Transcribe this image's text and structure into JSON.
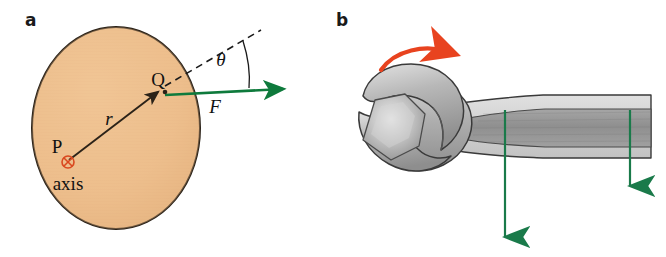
{
  "figure": {
    "background_color": "#ffffff",
    "width": 666,
    "height": 257
  },
  "panel_a": {
    "label": "a",
    "caption_letter": "a",
    "disk": {
      "name": "rigid-body-disk",
      "fill_color": "#edbe8c",
      "stroke_color": "#2b2218",
      "center_x": 116,
      "center_y": 128,
      "radius_x": 84,
      "radius_y": 101
    },
    "labels": {
      "pivot_point": "P",
      "axis": "axis",
      "application_point": "Q",
      "radius": "r",
      "force": "F",
      "angle": "θ"
    },
    "colors": {
      "force_arrow": "#0e7a3c",
      "radius_arrow": "#2b2218",
      "axis_symbol": "#d9481f",
      "dashed_line": "#1a1a1a"
    }
  },
  "panel_b": {
    "label": "b",
    "caption_letter": "b",
    "labels": {
      "rotation_arrow": "rotation-direction",
      "force_arrow_long": "applied-force-long",
      "force_arrow_short": "applied-force-short"
    },
    "colors": {
      "wrench_light": "#d9d9d9",
      "wrench_mid": "#a8a8a8",
      "wrench_dark": "#8a8a8a",
      "wrench_outline": "#3a3a3a",
      "rotation_arrow": "#e8431f",
      "force_arrow": "#1a7a4a"
    }
  }
}
